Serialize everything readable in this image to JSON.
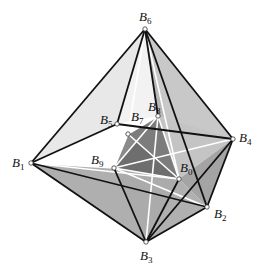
{
  "figure": {
    "vertices": {
      "B0": [
        179,
        179
      ],
      "B1": [
        31,
        163
      ],
      "B2": [
        207,
        207
      ],
      "B3": [
        146,
        242
      ],
      "B4": [
        233,
        139
      ],
      "B5": [
        117,
        124
      ],
      "B6": [
        145,
        29
      ],
      "B7": [
        128,
        134
      ],
      "B8": [
        158,
        116
      ],
      "B9": [
        114,
        168
      ]
    },
    "labels": [
      {
        "id": "B6",
        "base": "B",
        "sub": "6",
        "x": 139,
        "y": 10
      },
      {
        "id": "B5",
        "base": "B",
        "sub": "5",
        "x": 100,
        "y": 113
      },
      {
        "id": "B7",
        "base": "B",
        "sub": "7",
        "x": 131,
        "y": 110
      },
      {
        "id": "B8",
        "base": "B",
        "sub": "8",
        "x": 148,
        "y": 100
      },
      {
        "id": "B4",
        "base": "B",
        "sub": "4",
        "x": 239,
        "y": 131
      },
      {
        "id": "B1",
        "base": "B",
        "sub": "1",
        "x": 12,
        "y": 156
      },
      {
        "id": "B9",
        "base": "B",
        "sub": "9",
        "x": 91,
        "y": 153
      },
      {
        "id": "B0",
        "base": "B",
        "sub": "0",
        "x": 180,
        "y": 161
      },
      {
        "id": "B2",
        "base": "B",
        "sub": "2",
        "x": 214,
        "y": 207
      },
      {
        "id": "B3",
        "base": "B",
        "sub": "3",
        "x": 140,
        "y": 249
      }
    ],
    "colors": {
      "light_face": "#e6e6e6",
      "mid_face": "#bdbdbd",
      "dark_face": "#9a9a9a",
      "inner_dark": "#6e6e6e",
      "edge": "#111111",
      "white_edge": "#ffffff"
    }
  }
}
